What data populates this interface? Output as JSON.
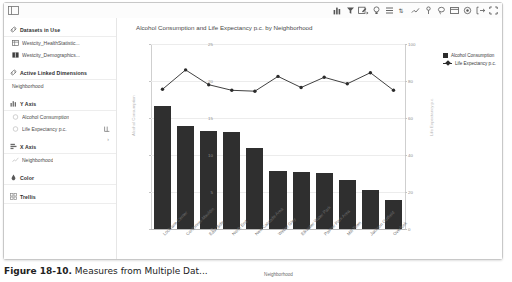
{
  "window": {
    "panel_toggle_icon": "collapse-panel-icon",
    "toolbar_icons": [
      "bar-chart-icon",
      "filter-icon",
      "edit-chart-icon",
      "bulb-icon",
      "columns-icon",
      "sort-icon",
      "trend-icon",
      "annotation-icon",
      "lasso-icon",
      "table-icon",
      "target-icon",
      "export-icon",
      "fullscreen-icon"
    ]
  },
  "sidebar": {
    "sections": [
      {
        "id": "datasets-in-use",
        "icon": "link-icon",
        "label": "Datasets in Use",
        "items": [
          {
            "icon": "table-dataset-icon",
            "label": "Westcity_HealthStatistic..."
          },
          {
            "icon": "table-dataset-icon",
            "label": "Westcity_Demographics..."
          }
        ]
      },
      {
        "id": "active-linked-dimensions",
        "icon": "link-icon",
        "label": "Active Linked Dimensions",
        "plain_items": [
          "Neighborhood"
        ]
      },
      {
        "id": "y-axis",
        "icon": "y-axis-icon",
        "label": "Y Axis",
        "items": [
          {
            "icon": "measure-icon",
            "label": "Alcohol Consumption"
          },
          {
            "icon": "measure-icon",
            "label": "Life Expectancy p.c.",
            "trailing_icon": "axis-scale-icon"
          }
        ]
      },
      {
        "id": "x-axis",
        "icon": "x-axis-icon",
        "label": "X Axis",
        "items": [
          {
            "icon": "dimension-icon",
            "label": "Neighborhood"
          }
        ]
      },
      {
        "id": "color",
        "icon": "color-icon",
        "label": "Color",
        "items": []
      },
      {
        "id": "trellis",
        "icon": "trellis-icon",
        "label": "Trellis",
        "items": [],
        "chevron": "›"
      }
    ]
  },
  "chart_data": {
    "type": "bar",
    "title": "Alcohol Consumption and Life Expectancy p.c. by Neighborhood",
    "xlabel": "Neighborhood",
    "ylabel": "Alcohol Consumption",
    "ylabel_right": "Life Expectancy p.c.",
    "categories": [
      "Lockrane Center",
      "Cordonner-Mauldin",
      "East Side",
      "North End",
      "New Cascade Area",
      "Weber Gley",
      "Elkwater Water Park",
      "Palmer Park Area",
      "Mill Town",
      "Jackson Outfield",
      "Overlook"
    ],
    "series": [
      {
        "name": "Alcohol Consumption",
        "type": "bar",
        "axis": "left",
        "color": "#2f2f2f",
        "values": [
          16.6,
          13.9,
          13.2,
          13.1,
          10.9,
          7.9,
          7.7,
          7.6,
          6.6,
          5.3,
          3.9
        ]
      },
      {
        "name": "Life Expectancy p.c.",
        "type": "line",
        "axis": "right",
        "color": "#2b2b2b",
        "values": [
          75.5,
          86.0,
          78.0,
          75.0,
          74.5,
          82.5,
          76.5,
          82.0,
          78.5,
          84.5,
          75.0
        ]
      }
    ],
    "ylim": [
      0,
      25
    ],
    "yticks": [
      0,
      5,
      10,
      15,
      20,
      25
    ],
    "ylim_right": [
      0,
      100
    ],
    "yticks_right": [
      0,
      20,
      40,
      60,
      80,
      100
    ],
    "grid": true,
    "legend_position": "top-right",
    "legend": [
      "Alcohol Consumption",
      "Life Expectancy p.c."
    ]
  },
  "caption": {
    "number": "Figure 18-10.",
    "text": " Measures from Multiple Dat..."
  }
}
